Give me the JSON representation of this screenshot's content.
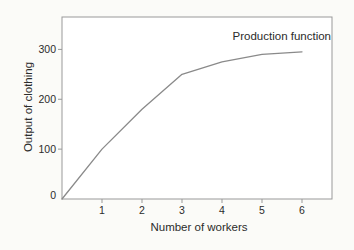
{
  "chart_data": {
    "type": "line",
    "annotation": "Production function",
    "xlabel": "Number of workers",
    "ylabel": "Output of clothing",
    "x": [
      0,
      1,
      2,
      3,
      4,
      5,
      6
    ],
    "values": [
      0,
      100,
      180,
      250,
      275,
      290,
      295
    ],
    "series": [
      {
        "name": "Production function",
        "values": [
          0,
          100,
          180,
          250,
          275,
          290,
          295
        ]
      }
    ],
    "x_ticks": [
      "1",
      "2",
      "3",
      "4",
      "5",
      "6"
    ],
    "y_ticks": [
      "0",
      "100",
      "200",
      "300"
    ],
    "xlim": [
      0,
      6.75
    ],
    "ylim": [
      0,
      365
    ],
    "grid": false,
    "legend_position": "annotation-top-right",
    "line_color": "#8a8a8a",
    "frame_color": "#999999",
    "background_color": "#fbfbf8",
    "plot_background_color": "#ffffff",
    "text_color": "#2b2b2b"
  }
}
